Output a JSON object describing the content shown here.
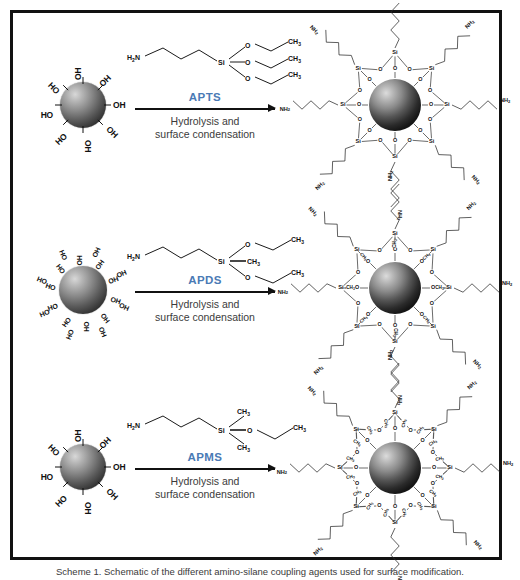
{
  "figure": {
    "caption": "Scheme 1. Schematic of the different amino-silane coupling agents used for surface modification.",
    "frame_color": "#111111",
    "accent_color": "#4a7ab5",
    "text_color": "#3b3b3b"
  },
  "common": {
    "condition_line1": "Hydrolysis and",
    "condition_line2": "surface condensation",
    "hydroxyl_label": "OH",
    "hydroxyl_label_reversed": "HO",
    "amine_label": "NH",
    "amine_label_reversed": "H",
    "amine_sub": "2",
    "methyl_label": "CH",
    "methyl_sub": "3",
    "oxygen_label": "O",
    "silicon_label": "Si",
    "nitrogen_label": "N"
  },
  "rows": [
    {
      "id": "row-apts",
      "reagent_label": "APTS",
      "reagent_name": "3-aminopropyltriethoxysilane",
      "reactant": {
        "particle": "silica-nanoparticle",
        "hydroxyl_count": 8,
        "hydroxyls": [
          "OH",
          "OH",
          "OH",
          "OH",
          "HO",
          "HO",
          "HO",
          "HO"
        ]
      },
      "reagent": {
        "head": "H2N",
        "chain_carbons": 3,
        "center_atom": "Si",
        "substituents": [
          {
            "type": "ethoxy",
            "o": "O",
            "terminal": "CH3"
          },
          {
            "type": "ethoxy",
            "o": "O",
            "terminal": "CH3"
          },
          {
            "type": "ethoxy",
            "o": "O",
            "terminal": "CH3"
          }
        ]
      },
      "product": {
        "particle": "silica-nanoparticle",
        "arms": 8,
        "arm_terminal": "NH2",
        "si_label": "Si",
        "bridge_label": "O",
        "si_methyls_per_arm": 0
      }
    },
    {
      "id": "row-apds",
      "reagent_label": "APDS",
      "reagent_name": "3-aminopropylmethyldiethoxysilane",
      "reactant": {
        "particle": "silica-nanoparticle",
        "hydroxyl_count": 18,
        "hydroxyls": [
          "OH",
          "OH",
          "OH",
          "OH",
          "OH",
          "OH",
          "OH",
          "OH",
          "OH",
          "HO",
          "HO",
          "HO",
          "HO",
          "HO",
          "HO",
          "HO",
          "HO",
          "HO"
        ]
      },
      "reagent": {
        "head": "H2N",
        "chain_carbons": 3,
        "center_atom": "Si",
        "substituents": [
          {
            "type": "ethoxy",
            "o": "O",
            "terminal": "CH3"
          },
          {
            "type": "methyl",
            "terminal": "CH3"
          },
          {
            "type": "ethoxy",
            "o": "O",
            "terminal": "CH3"
          }
        ]
      },
      "product": {
        "particle": "silica-nanoparticle",
        "arms": 8,
        "arm_terminal": "NH2",
        "si_label": "Si",
        "bridge_label": "O",
        "si_methyls_per_arm": 1,
        "methyl_label": "CH3"
      }
    },
    {
      "id": "row-apms",
      "reagent_label": "APMS",
      "reagent_name": "3-aminopropyldimethylethoxysilane",
      "reactant": {
        "particle": "silica-nanoparticle",
        "hydroxyl_count": 8,
        "hydroxyls": [
          "OH",
          "OH",
          "OH",
          "OH",
          "HO",
          "HO",
          "HO",
          "HO"
        ]
      },
      "reagent": {
        "head": "H2N",
        "chain_carbons": 3,
        "center_atom": "Si",
        "substituents": [
          {
            "type": "methyl",
            "terminal": "CH3"
          },
          {
            "type": "ethoxy",
            "o": "O",
            "terminal": "CH3"
          },
          {
            "type": "methyl",
            "terminal": "CH3"
          }
        ]
      },
      "product": {
        "particle": "silica-nanoparticle",
        "arms": 8,
        "arm_terminal": "NH2",
        "si_label": "Si",
        "bridge_label": "O",
        "si_methyls_per_arm": 2,
        "methyl_label": "CH3"
      }
    }
  ]
}
